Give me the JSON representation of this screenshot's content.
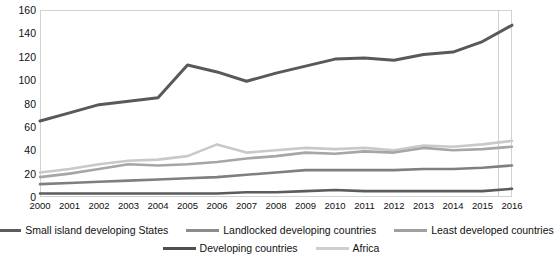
{
  "chart_data": {
    "type": "line",
    "title": "",
    "subtitle": "",
    "xlabel": "",
    "ylabel": "",
    "ylim": [
      0,
      160
    ],
    "ytick_step": 20,
    "yticks": [
      "0",
      "20",
      "40",
      "60",
      "80",
      "100",
      "120",
      "140",
      "160"
    ],
    "grid": false,
    "legend_position": "bottom",
    "categories": [
      "2000",
      "2001",
      "2002",
      "2003",
      "2004",
      "2005",
      "2006",
      "2007",
      "2008",
      "2009",
      "2010",
      "2011",
      "2012",
      "2013",
      "2014",
      "2015",
      "2016"
    ],
    "series": [
      {
        "name": "Developing countries",
        "color": "#595959",
        "width": 3.0,
        "values": [
          65,
          72,
          79,
          82,
          85,
          113,
          107,
          99,
          106,
          112,
          118,
          119,
          117,
          122,
          124,
          133,
          147
        ]
      },
      {
        "name": "Africa",
        "color": "#c9c9c9",
        "width": 2.6,
        "values": [
          21,
          24,
          28,
          31,
          32,
          35,
          45,
          38,
          40,
          42,
          41,
          42,
          40,
          44,
          43,
          45,
          48
        ]
      },
      {
        "name": "Landlocked developing countries",
        "color": "#a6a6a6",
        "width": 2.6,
        "values": [
          17,
          20,
          24,
          28,
          27,
          28,
          30,
          33,
          35,
          38,
          37,
          39,
          38,
          42,
          40,
          41,
          43
        ]
      },
      {
        "name": "Least developed countries",
        "color": "#7f7f7f",
        "width": 2.6,
        "values": [
          11,
          12,
          13,
          14,
          15,
          16,
          17,
          19,
          21,
          23,
          23,
          23,
          23,
          24,
          24,
          25,
          27
        ]
      },
      {
        "name": "Small island developing States",
        "color": "#5c5c5c",
        "width": 2.6,
        "values": [
          3,
          3,
          3,
          3,
          3,
          3,
          3,
          4,
          4,
          5,
          6,
          5,
          5,
          5,
          5,
          5,
          7
        ]
      }
    ]
  },
  "legend": {
    "row1": [
      {
        "label": "Small island developing States",
        "color": "#5c5c5c"
      },
      {
        "label": "Landlocked developing countries",
        "color": "#8c8c8c"
      },
      {
        "label": "Least developed countries",
        "color": "#a0a0a0"
      }
    ],
    "row2": [
      {
        "label": "Developing countries",
        "color": "#4f4f4f"
      },
      {
        "label": "Africa",
        "color": "#cfcfcf"
      }
    ]
  }
}
